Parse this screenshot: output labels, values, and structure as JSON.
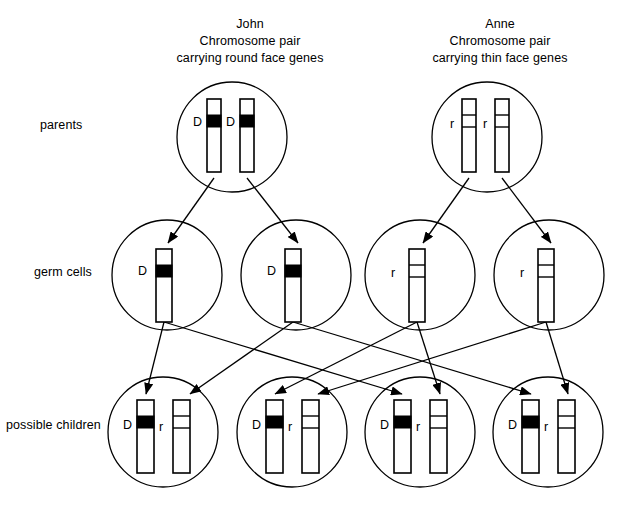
{
  "diagram": {
    "title_john": "John",
    "title_anne": "Anne",
    "john_header": {
      "name": "John",
      "line2": "Chromosome pair",
      "line3": "carrying round face genes"
    },
    "anne_header": {
      "name": "Anne",
      "line2": "Chromosome pair",
      "line3": "carrying thin face genes"
    },
    "row_labels": {
      "parents": "parents",
      "germ_cells": "germ cells",
      "possible_children": "possible children"
    },
    "alleles": {
      "dominant": "D",
      "recessive": "r"
    },
    "colors": {
      "ink": "#000000",
      "background": "#ffffff",
      "dominant_band": "#000000",
      "recessive_band": "#ffffff"
    },
    "parents_row": [
      {
        "parent": "John",
        "cx": 232,
        "cy": 137,
        "r": 55,
        "chromosomes": [
          {
            "label": "D",
            "band": "dominant",
            "x": 207,
            "y": 99,
            "w": 14,
            "h": 73,
            "label_x": 193,
            "label_y": 115
          },
          {
            "label": "D",
            "band": "dominant",
            "x": 240,
            "y": 99,
            "w": 14,
            "h": 73,
            "label_x": 226,
            "label_y": 115
          }
        ]
      },
      {
        "parent": "Anne",
        "cx": 487,
        "cy": 137,
        "r": 55,
        "chromosomes": [
          {
            "label": "r",
            "band": "recessive",
            "x": 462,
            "y": 99,
            "w": 14,
            "h": 73,
            "label_x": 450,
            "label_y": 117
          },
          {
            "label": "r",
            "band": "recessive",
            "x": 495,
            "y": 99,
            "w": 14,
            "h": 73,
            "label_x": 483,
            "label_y": 117
          }
        ]
      }
    ],
    "germ_cells_row": [
      {
        "label": "D",
        "band": "dominant",
        "cx": 167,
        "cy": 275,
        "r": 55,
        "x": 156,
        "y": 249,
        "w": 16,
        "h": 73,
        "label_x": 138,
        "label_y": 264
      },
      {
        "label": "D",
        "band": "dominant",
        "cx": 296,
        "cy": 275,
        "r": 55,
        "x": 285,
        "y": 249,
        "w": 16,
        "h": 73,
        "label_x": 267,
        "label_y": 264
      },
      {
        "label": "r",
        "band": "recessive",
        "cx": 420,
        "cy": 275,
        "r": 55,
        "x": 409,
        "y": 249,
        "w": 16,
        "h": 73,
        "label_x": 391,
        "label_y": 266
      },
      {
        "label": "r",
        "band": "recessive",
        "cx": 549,
        "cy": 275,
        "r": 55,
        "x": 538,
        "y": 249,
        "w": 16,
        "h": 73,
        "label_x": 520,
        "label_y": 266
      }
    ],
    "children_row": [
      {
        "index": 1,
        "cx": 163,
        "cy": 432,
        "r": 55,
        "genotype": "Dr",
        "chromosomes": [
          {
            "label": "D",
            "band": "dominant",
            "x": 137,
            "y": 400,
            "w": 17,
            "h": 73,
            "label_x": 123,
            "label_y": 418
          },
          {
            "label": "r",
            "band": "recessive",
            "x": 173,
            "y": 400,
            "w": 17,
            "h": 73,
            "label_x": 159,
            "label_y": 420
          }
        ]
      },
      {
        "index": 2,
        "cx": 292,
        "cy": 432,
        "r": 55,
        "genotype": "Dr",
        "chromosomes": [
          {
            "label": "D",
            "band": "dominant",
            "x": 266,
            "y": 400,
            "w": 17,
            "h": 73,
            "label_x": 252,
            "label_y": 418
          },
          {
            "label": "r",
            "band": "recessive",
            "x": 302,
            "y": 400,
            "w": 17,
            "h": 73,
            "label_x": 288,
            "label_y": 420
          }
        ]
      },
      {
        "index": 3,
        "cx": 420,
        "cy": 432,
        "r": 55,
        "genotype": "Dr",
        "chromosomes": [
          {
            "label": "D",
            "band": "dominant",
            "x": 394,
            "y": 400,
            "w": 17,
            "h": 73,
            "label_x": 380,
            "label_y": 418
          },
          {
            "label": "r",
            "band": "recessive",
            "x": 430,
            "y": 400,
            "w": 17,
            "h": 73,
            "label_x": 416,
            "label_y": 420
          }
        ]
      },
      {
        "index": 4,
        "cx": 548,
        "cy": 432,
        "r": 55,
        "genotype": "Dr",
        "chromosomes": [
          {
            "label": "D",
            "band": "dominant",
            "x": 522,
            "y": 400,
            "w": 17,
            "h": 73,
            "label_x": 508,
            "label_y": 418
          },
          {
            "label": "r",
            "band": "recessive",
            "x": 558,
            "y": 400,
            "w": 17,
            "h": 73,
            "label_x": 544,
            "label_y": 420
          }
        ]
      }
    ],
    "arrows_parents_to_germ": [
      {
        "from": [
          214,
          178
        ],
        "to": [
          168,
          243
        ]
      },
      {
        "from": [
          247,
          178
        ],
        "to": [
          298,
          243
        ]
      },
      {
        "from": [
          469,
          178
        ],
        "to": [
          423,
          243
        ]
      },
      {
        "from": [
          502,
          178
        ],
        "to": [
          551,
          243
        ]
      }
    ],
    "arrows_germ_to_children": [
      {
        "from": [
          164,
          322
        ],
        "to": [
          146,
          394
        ]
      },
      {
        "from": [
          164,
          322
        ],
        "to": [
          402,
          394
        ]
      },
      {
        "from": [
          293,
          322
        ],
        "to": [
          190,
          394
        ]
      },
      {
        "from": [
          293,
          322
        ],
        "to": [
          531,
          394
        ]
      },
      {
        "from": [
          417,
          322
        ],
        "to": [
          275,
          394
        ]
      },
      {
        "from": [
          417,
          322
        ],
        "to": [
          440,
          394
        ]
      },
      {
        "from": [
          546,
          322
        ],
        "to": [
          318,
          394
        ]
      },
      {
        "from": [
          546,
          322
        ],
        "to": [
          568,
          394
        ]
      }
    ]
  }
}
